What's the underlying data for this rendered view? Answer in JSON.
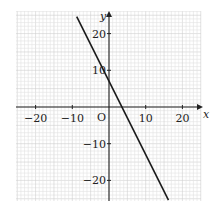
{
  "chart_data": {
    "type": "line",
    "title": "",
    "xlabel": "x",
    "ylabel": "y",
    "origin_label": "O",
    "xlim": [
      -25,
      25
    ],
    "ylim": [
      -26,
      26
    ],
    "grid": true,
    "grid_step": 1,
    "x_ticks": [
      -20,
      -10,
      10,
      20
    ],
    "x_tick_labels": [
      "−20",
      "−10",
      "10",
      "20"
    ],
    "y_ticks": [
      20,
      10,
      -10,
      -20
    ],
    "y_tick_labels": [
      "20",
      "10",
      "−10",
      "−20"
    ],
    "series": [
      {
        "name": "line",
        "equation": "y = -2x + 7",
        "slope": -2,
        "intercept": 7,
        "x": [
          -8.8,
          16.2
        ],
        "y": [
          24.6,
          -25.4
        ],
        "color": "#1a1a1a"
      }
    ],
    "colors": {
      "grid": "#e2e2e2",
      "axis": "#222222",
      "line": "#1a1a1a"
    }
  }
}
